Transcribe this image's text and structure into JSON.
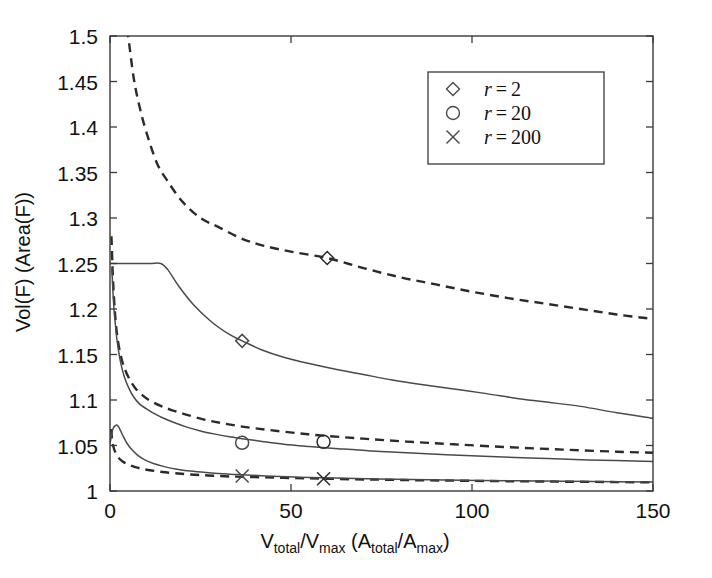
{
  "chart_data": {
    "type": "line",
    "title": "",
    "xlabel": "V_total/V_max (A_total/A_max)",
    "xlabel_parts": {
      "v1": "V",
      "v1sub": "total",
      "slash1": "/",
      "v2": "V",
      "v2sub": "max",
      "open": " (",
      "a1": "A",
      "a1sub": "total",
      "slash2": "/",
      "a2": "A",
      "a2sub": "max",
      "close": ")"
    },
    "ylabel": "Vol(F)  (Area(F))",
    "xlim": [
      0,
      150
    ],
    "ylim": [
      1,
      1.5
    ],
    "xticks": [
      0,
      50,
      100,
      150
    ],
    "xtick_labels": [
      "0",
      "50",
      "100",
      "150"
    ],
    "yticks": [
      1,
      1.05,
      1.1,
      1.15,
      1.2,
      1.25,
      1.3,
      1.35,
      1.4,
      1.45,
      1.5
    ],
    "ytick_labels": [
      "1",
      "1.05",
      "1.1",
      "1.15",
      "1.2",
      "1.25",
      "1.3",
      "1.35",
      "1.4",
      "1.45",
      "1.5"
    ],
    "grid": false,
    "legend_position": "top-right",
    "legend": [
      {
        "marker": "diamond",
        "label_prefix": "r",
        "label_eq": "=",
        "label_value": "2",
        "label": "r = 2"
      },
      {
        "marker": "circle",
        "label_prefix": "r",
        "label_eq": "=",
        "label_value": "20",
        "label": "r = 20"
      },
      {
        "marker": "cross",
        "label_prefix": "r",
        "label_eq": "=",
        "label_value": "200",
        "label": "r = 200"
      }
    ],
    "series": [
      {
        "name": "r = 2 (dashed)",
        "marker": "diamond",
        "style": "dashed",
        "marker_point": {
          "x": 60,
          "y": 1.256
        },
        "x": [
          0.5,
          1,
          1.5,
          2,
          2.6,
          3.2,
          4,
          5,
          6.5,
          8,
          10,
          13,
          16,
          20,
          25,
          30,
          36,
          42,
          50,
          60,
          70,
          80,
          90,
          100,
          110,
          120,
          130,
          140,
          150
        ],
        "y": [
          2.2,
          1.95,
          1.8,
          1.72,
          1.64,
          1.58,
          1.52,
          1.5,
          1.455,
          1.425,
          1.395,
          1.36,
          1.34,
          1.318,
          1.3,
          1.29,
          1.278,
          1.27,
          1.263,
          1.256,
          1.245,
          1.235,
          1.227,
          1.219,
          1.212,
          1.206,
          1.2,
          1.194,
          1.189
        ]
      },
      {
        "name": "r = 2 (solid)",
        "marker": "diamond",
        "style": "solid",
        "marker_point": {
          "x": 36.5,
          "y": 1.165
        },
        "x": [
          0,
          6,
          11,
          14,
          16,
          19,
          23,
          28,
          33,
          36.5,
          42,
          48,
          55,
          62,
          70,
          78,
          86,
          95,
          104,
          112,
          120,
          130,
          140,
          150
        ],
        "y": [
          1.25,
          1.25,
          1.25,
          1.25,
          1.243,
          1.225,
          1.205,
          1.186,
          1.172,
          1.165,
          1.155,
          1.147,
          1.14,
          1.134,
          1.128,
          1.122,
          1.117,
          1.112,
          1.107,
          1.102,
          1.098,
          1.093,
          1.086,
          1.08
        ]
      },
      {
        "name": "r = 20 (dashed)",
        "marker": "circle",
        "style": "dashed",
        "marker_point": {
          "x": 59,
          "y": 1.054
        },
        "x": [
          0.4,
          0.8,
          1.3,
          1.8,
          2.4,
          3.2,
          4.2,
          5.5,
          7,
          9,
          11,
          14,
          17,
          21,
          26,
          31,
          37,
          44,
          52,
          59,
          70,
          82,
          95,
          110,
          125,
          140,
          150
        ],
        "y": [
          1.28,
          1.235,
          1.2,
          1.177,
          1.16,
          1.145,
          1.133,
          1.122,
          1.113,
          1.105,
          1.0995,
          1.0935,
          1.089,
          1.084,
          1.0785,
          1.0745,
          1.0705,
          1.067,
          1.0635,
          1.0608,
          1.0575,
          1.0543,
          1.0513,
          1.0482,
          1.0455,
          1.0432,
          1.042
        ]
      },
      {
        "name": "r = 20 (solid)",
        "marker": "circle",
        "style": "solid",
        "marker_point": {
          "x": 36.5,
          "y": 1.053
        },
        "x": [
          0.5,
          1,
          1.6,
          2.2,
          3,
          4,
          5.2,
          6.6,
          8.2,
          10,
          12,
          14.5,
          17.5,
          21,
          25,
          29,
          33,
          36.5,
          42,
          48,
          55,
          63,
          72,
          82,
          93,
          105,
          118,
          132,
          150
        ],
        "y": [
          1.245,
          1.206,
          1.178,
          1.158,
          1.14,
          1.125,
          1.113,
          1.103,
          1.0955,
          1.0905,
          1.0855,
          1.0805,
          1.0755,
          1.0705,
          1.066,
          1.0625,
          1.0595,
          1.0575,
          1.0545,
          1.0515,
          1.049,
          1.0465,
          1.044,
          1.042,
          1.0398,
          1.0378,
          1.036,
          1.0342,
          1.0325
        ]
      },
      {
        "name": "r = 200 (dashed)",
        "marker": "cross",
        "style": "dashed",
        "marker_point": {
          "x": 59,
          "y": 1.0135
        },
        "x": [
          0.3,
          0.6,
          1,
          1.5,
          2.2,
          3,
          4,
          5.4,
          7,
          9,
          11.5,
          14.5,
          18,
          22,
          27,
          33,
          40,
          48,
          59,
          72,
          86,
          100,
          115,
          130,
          150
        ],
        "y": [
          1.068,
          1.056,
          1.0478,
          1.0422,
          1.0372,
          1.034,
          1.0312,
          1.0285,
          1.0262,
          1.0242,
          1.0225,
          1.0209,
          1.0195,
          1.0182,
          1.0171,
          1.016,
          1.0152,
          1.0145,
          1.0135,
          1.0126,
          1.0118,
          1.0112,
          1.0106,
          1.0101,
          1.0095
        ]
      },
      {
        "name": "r = 200 (solid)",
        "marker": "cross",
        "style": "solid",
        "marker_point": {
          "x": 36.5,
          "y": 1.0165
        },
        "x": [
          0,
          0.8,
          1.6,
          2.2,
          2.8,
          3.6,
          4.6,
          6,
          7.6,
          9.5,
          12,
          15,
          18.5,
          23,
          28,
          33,
          36.5,
          43,
          52,
          62,
          74,
          88,
          102,
          118,
          134,
          150
        ],
        "y": [
          1.052,
          1.068,
          1.0722,
          1.0715,
          1.0672,
          1.0605,
          1.053,
          1.0455,
          1.0395,
          1.0345,
          1.0302,
          1.0268,
          1.024,
          1.0216,
          1.0198,
          1.0185,
          1.0178,
          1.0166,
          1.0152,
          1.0142,
          1.0132,
          1.0123,
          1.0116,
          1.011,
          1.0104,
          1.0099
        ]
      }
    ]
  },
  "colors": {
    "axis": "#3a3a3a",
    "solid_line": "#4a4a4a",
    "dashed_line": "#2b2b2b",
    "text": "#111111",
    "background": "#ffffff"
  }
}
